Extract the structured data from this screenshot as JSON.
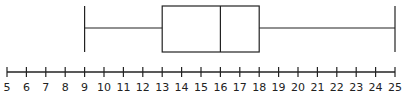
{
  "chart_data": {
    "type": "boxplot",
    "title": "",
    "xlabel": "",
    "ylabel": "",
    "xlim": [
      5,
      25
    ],
    "grid": false,
    "legend": null,
    "ticks": [
      5,
      6,
      7,
      8,
      9,
      10,
      11,
      12,
      13,
      14,
      15,
      16,
      17,
      18,
      19,
      20,
      21,
      22,
      23,
      24,
      25
    ],
    "tick_labels": [
      "5",
      "6",
      "7",
      "8",
      "9",
      "10",
      "11",
      "12",
      "13",
      "14",
      "15",
      "16",
      "17",
      "18",
      "19",
      "20",
      "21",
      "22",
      "23",
      "24",
      "25"
    ],
    "box": {
      "min": 9,
      "q1": 13,
      "median": 16,
      "q3": 18,
      "max": 25
    },
    "colors": {
      "stroke": "#222222",
      "background": "#ffffff"
    }
  }
}
